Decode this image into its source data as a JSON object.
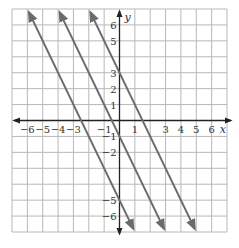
{
  "chart_data": {
    "type": "line",
    "title": "",
    "xlabel": "x",
    "ylabel": "y",
    "xlim": [
      -7,
      7
    ],
    "ylim": [
      -7,
      7
    ],
    "grid": true,
    "x_ticks": [
      "−6",
      "−5",
      "−4",
      "−3",
      "−1",
      "1",
      "3",
      "4",
      "5",
      "6"
    ],
    "x_tick_values": [
      -6,
      -5,
      -4,
      -3,
      -1,
      1,
      3,
      4,
      5,
      6
    ],
    "y_ticks": [
      "6",
      "5",
      "3",
      "2",
      "1",
      "−1",
      "−2",
      "−5",
      "−6"
    ],
    "y_tick_values": [
      6,
      5,
      3,
      2,
      1,
      -1,
      -2,
      -5,
      -6
    ],
    "series": [
      {
        "name": "y = -2x - 5",
        "slope": -2,
        "intercept": -5,
        "color": "#6b6b6b"
      },
      {
        "name": "y = -2x - 1",
        "slope": -2,
        "intercept": -1,
        "color": "#6b6b6b"
      },
      {
        "name": "y = -2x + 3",
        "slope": -2,
        "intercept": 3,
        "color": "#6b6b6b"
      }
    ]
  },
  "colors": {
    "grid": "#b8b8b8",
    "axis": "#222222",
    "line": "#6b6b6b"
  }
}
